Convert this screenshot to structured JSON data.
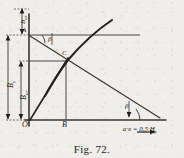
{
  "figure": {
    "caption": "Fig. 72.",
    "type": "engineering-line-diagram",
    "background_color": "#efeeea",
    "ink_color": "#24211d"
  },
  "axes": {
    "y_axis": {
      "name": "vertical-axis",
      "x": 29,
      "y_top": 14,
      "y_bottom": 126
    },
    "x_axis": {
      "name": "horizontal-axis",
      "y": 120,
      "x_left": 25,
      "x_right": 166
    },
    "x_axis_label": "a·x = 0,5·H",
    "x_axis_label_sub": "y",
    "x_axis_arrow": "→"
  },
  "points": [
    {
      "id": "O",
      "label": "O",
      "x": 29,
      "y": 120,
      "label_x": 23,
      "label_y": 122
    },
    {
      "id": "A",
      "label": "A",
      "x": 29,
      "y": 35,
      "label_x": 22,
      "label_y": 30
    },
    {
      "id": "C",
      "label": "C",
      "x": 66,
      "y": 61,
      "label_x": 62,
      "label_y": 51
    },
    {
      "id": "B",
      "label": "B",
      "x": 66,
      "y": 120,
      "label_x": 61,
      "label_y": 122
    }
  ],
  "angles": [
    {
      "id": "beta-upper",
      "label": "β",
      "x": 50,
      "y": 36
    },
    {
      "id": "beta-lower",
      "label": "β",
      "x": 126,
      "y": 104
    }
  ],
  "dimensions": [
    {
      "id": "dim-top",
      "label": "B",
      "sub": "ur",
      "orientation": "vertical",
      "x": 14,
      "y_top": 8,
      "y_bottom": 35
    },
    {
      "id": "dim-outer",
      "label": "B",
      "sub": "y",
      "orientation": "vertical",
      "x": 6,
      "y_top": 35,
      "y_bottom": 120
    },
    {
      "id": "dim-inner",
      "label": "B",
      "sub": "ur",
      "orientation": "vertical",
      "x": 20,
      "y_top": 61,
      "y_bottom": 120
    }
  ],
  "curves": [
    {
      "id": "concave-curve",
      "name": "rising-curve-through-C",
      "description": "curve from origin rising through C to upper right"
    },
    {
      "id": "line-OC",
      "name": "straight-line-O-to-C",
      "description": "straight line from O through C"
    },
    {
      "id": "line-AC",
      "name": "declining-line-A-through-C",
      "description": "straight line from A through C descending to lower right"
    },
    {
      "id": "line-A-horizontal",
      "name": "horizontal-line-at-A",
      "description": "horizontal construction line at level A"
    },
    {
      "id": "line-C-horizontal",
      "name": "horizontal-line-at-C",
      "description": "horizontal construction line at level C"
    },
    {
      "id": "line-B-vertical",
      "name": "vertical-line-at-B",
      "description": "vertical construction line from B up to C"
    }
  ]
}
